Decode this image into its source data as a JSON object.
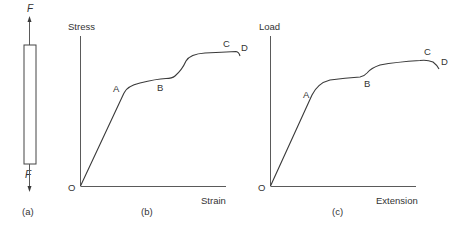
{
  "figure": {
    "panel_a": {
      "caption": "(a)",
      "force_top_label": "F",
      "force_bottom_label": "F",
      "description": "Bar specimen under tension, forces F at both ends"
    },
    "panel_b": {
      "caption": "(b)",
      "y_label": "Stress",
      "x_label": "Strain",
      "origin_label": "O",
      "points": [
        "A",
        "B",
        "C",
        "D"
      ]
    },
    "panel_c": {
      "caption": "(c)",
      "y_label": "Load",
      "x_label": "Extension",
      "origin_label": "O",
      "points": [
        "A",
        "B",
        "C",
        "D"
      ]
    }
  },
  "colors": {
    "line": "#3a3a3a",
    "text": "#333333",
    "background": "#ffffff"
  }
}
